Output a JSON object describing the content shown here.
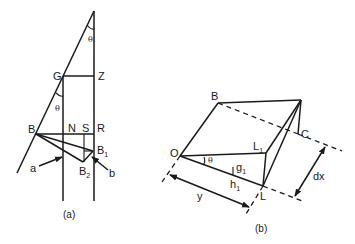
{
  "figure_a": {
    "caption": "(a)",
    "labels": {
      "G": "G",
      "Z": "Z",
      "B": "B",
      "N": "N",
      "S": "S",
      "R": "R",
      "B1": "B",
      "B1_sub": "1",
      "B2": "B",
      "B2_sub": "2",
      "a": "a",
      "b": "b",
      "theta_top": "θ",
      "theta_mid": "θ"
    }
  },
  "figure_b": {
    "caption": "(b)",
    "labels": {
      "B": "B",
      "C": "C",
      "O": "O",
      "L": "L",
      "L1": "L",
      "L1_sub": "1",
      "g1": "g",
      "g1_sub": "1",
      "h1": "h",
      "h1_sub": "1",
      "theta": "θ",
      "y": "y",
      "dx": "dx"
    }
  },
  "colors": {
    "stroke": "#1a1a1a",
    "background": "#ffffff"
  }
}
